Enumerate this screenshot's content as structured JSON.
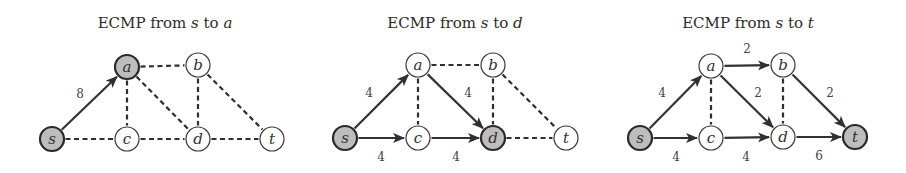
{
  "figure": {
    "panels": [
      {
        "title_prefix": "ECMP from ",
        "title_src": "s",
        "title_mid": " to ",
        "title_dst": "a",
        "title_x": 165,
        "nodes": [
          {
            "id": "s",
            "label": "s",
            "x": 52,
            "y": 139,
            "highlighted": true
          },
          {
            "id": "a",
            "label": "a",
            "x": 127,
            "y": 67,
            "highlighted": true
          },
          {
            "id": "b",
            "label": "b",
            "x": 198,
            "y": 65,
            "highlighted": false
          },
          {
            "id": "c",
            "label": "c",
            "x": 127,
            "y": 139,
            "highlighted": false
          },
          {
            "id": "d",
            "label": "d",
            "x": 198,
            "y": 139,
            "highlighted": false
          },
          {
            "id": "t",
            "label": "t",
            "x": 272,
            "y": 139,
            "highlighted": false
          }
        ],
        "edges": [
          {
            "from": "s",
            "to": "a",
            "flow": true,
            "label": "8",
            "lx": 80,
            "ly": 94
          },
          {
            "from": "s",
            "to": "c",
            "flow": false
          },
          {
            "from": "a",
            "to": "b",
            "flow": false
          },
          {
            "from": "a",
            "to": "c",
            "flow": false
          },
          {
            "from": "a",
            "to": "d",
            "flow": false
          },
          {
            "from": "b",
            "to": "d",
            "flow": false
          },
          {
            "from": "b",
            "to": "t",
            "flow": false
          },
          {
            "from": "c",
            "to": "d",
            "flow": false
          },
          {
            "from": "d",
            "to": "t",
            "flow": false
          }
        ]
      },
      {
        "title_prefix": "ECMP from ",
        "title_src": "s",
        "title_mid": " to ",
        "title_dst": "d",
        "title_x": 455,
        "nodes": [
          {
            "id": "s",
            "label": "s",
            "x": 345,
            "y": 138,
            "highlighted": true
          },
          {
            "id": "a",
            "label": "a",
            "x": 418,
            "y": 65,
            "highlighted": false
          },
          {
            "id": "b",
            "label": "b",
            "x": 493,
            "y": 65,
            "highlighted": false
          },
          {
            "id": "c",
            "label": "c",
            "x": 418,
            "y": 138,
            "highlighted": false
          },
          {
            "id": "d",
            "label": "d",
            "x": 493,
            "y": 138,
            "highlighted": true
          },
          {
            "id": "t",
            "label": "t",
            "x": 566,
            "y": 138,
            "highlighted": false
          }
        ],
        "edges": [
          {
            "from": "s",
            "to": "a",
            "flow": true,
            "label": "4",
            "lx": 369,
            "ly": 93
          },
          {
            "from": "s",
            "to": "c",
            "flow": true,
            "label": "4",
            "lx": 381,
            "ly": 157
          },
          {
            "from": "a",
            "to": "b",
            "flow": false
          },
          {
            "from": "a",
            "to": "c",
            "flow": false
          },
          {
            "from": "a",
            "to": "d",
            "flow": true,
            "label": "4",
            "lx": 468,
            "ly": 93
          },
          {
            "from": "b",
            "to": "d",
            "flow": false
          },
          {
            "from": "b",
            "to": "t",
            "flow": false
          },
          {
            "from": "c",
            "to": "d",
            "flow": true,
            "label": "4",
            "lx": 456,
            "ly": 157
          },
          {
            "from": "d",
            "to": "t",
            "flow": false
          }
        ]
      },
      {
        "title_prefix": "ECMP from ",
        "title_src": "s",
        "title_mid": " to ",
        "title_dst": "t",
        "title_x": 748,
        "nodes": [
          {
            "id": "s",
            "label": "s",
            "x": 640,
            "y": 138,
            "highlighted": true
          },
          {
            "id": "a",
            "label": "a",
            "x": 711,
            "y": 66,
            "highlighted": false
          },
          {
            "id": "b",
            "label": "b",
            "x": 783,
            "y": 65,
            "highlighted": false
          },
          {
            "id": "c",
            "label": "c",
            "x": 711,
            "y": 138,
            "highlighted": false
          },
          {
            "id": "d",
            "label": "d",
            "x": 783,
            "y": 137,
            "highlighted": false
          },
          {
            "id": "t",
            "label": "t",
            "x": 855,
            "y": 137,
            "highlighted": true
          }
        ],
        "edges": [
          {
            "from": "s",
            "to": "a",
            "flow": true,
            "label": "4",
            "lx": 662,
            "ly": 93
          },
          {
            "from": "s",
            "to": "c",
            "flow": true,
            "label": "4",
            "lx": 676,
            "ly": 157
          },
          {
            "from": "a",
            "to": "b",
            "flow": true,
            "label": "2",
            "lx": 747,
            "ly": 49
          },
          {
            "from": "a",
            "to": "c",
            "flow": false
          },
          {
            "from": "a",
            "to": "d",
            "flow": true,
            "label": "2",
            "lx": 758,
            "ly": 93
          },
          {
            "from": "b",
            "to": "d",
            "flow": false
          },
          {
            "from": "b",
            "to": "t",
            "flow": true,
            "label": "2",
            "lx": 830,
            "ly": 93
          },
          {
            "from": "c",
            "to": "d",
            "flow": true,
            "label": "4",
            "lx": 746,
            "ly": 157
          },
          {
            "from": "d",
            "to": "t",
            "flow": true,
            "label": "6",
            "lx": 819,
            "ly": 156
          }
        ]
      }
    ],
    "node_radius": 12,
    "colors": {
      "highlight_fill": "#bdbdbd",
      "node_fill": "#ffffff",
      "stroke": "#333333",
      "text": "#2b2b2b"
    }
  }
}
